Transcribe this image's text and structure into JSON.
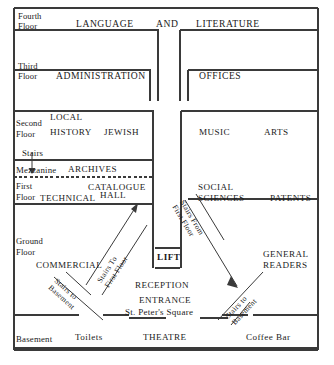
{
  "diagram": {
    "type": "building-section-plan",
    "line_color": "#3a3a3a",
    "background": "#ffffff"
  },
  "floors": [
    {
      "id": "fourth",
      "label_line1": "Fourth",
      "label_line2": "Floor",
      "left_departments": [
        "LANGUAGE",
        "AND"
      ],
      "right_departments": [
        "LITERATURE"
      ]
    },
    {
      "id": "third",
      "label_line1": "Third",
      "label_line2": "Floor",
      "left_departments": [
        "ADMINISTRATION"
      ],
      "right_departments": [
        "OFFICES"
      ]
    },
    {
      "id": "second",
      "label_line1": "Second",
      "label_line2": "Floor",
      "left_departments": [
        "LOCAL",
        "HISTORY",
        "JEWISH"
      ],
      "right_departments": [
        "MUSIC",
        "ARTS"
      ]
    },
    {
      "id": "mezzanine",
      "label_line1": "Mezzanine",
      "label_line2": "",
      "left_departments": [
        "ARCHIVES"
      ],
      "right_departments": []
    },
    {
      "id": "first",
      "label_line1": "First",
      "label_line2": "Floor",
      "left_departments": [
        "CATALOGUE",
        "TECHNICAL",
        "HALL"
      ],
      "right_departments": [
        "SOCIAL",
        "SCIENCES",
        "PATENTS"
      ]
    },
    {
      "id": "ground",
      "label_line1": "Ground",
      "label_line2": "Floor",
      "left_departments": [
        "COMMERCIAL"
      ],
      "right_departments": [
        "GENERAL",
        "READERS"
      ]
    },
    {
      "id": "basement",
      "label_line1": "Basement",
      "label_line2": "",
      "left_departments": [
        "Toilets"
      ],
      "right_departments": [
        "THEATRE",
        "Coffee Bar"
      ]
    }
  ],
  "labels": {
    "fourth_floor_1": "Fourth",
    "fourth_floor_2": "Floor",
    "language": "LANGUAGE",
    "and": "AND",
    "literature": "LITERATURE",
    "third_floor_1": "Third",
    "third_floor_2": "Floor",
    "administration": "ADMINISTRATION",
    "offices": "OFFICES",
    "second_floor_1": "Second",
    "second_floor_2": "Floor",
    "local": "LOCAL",
    "history": "HISTORY",
    "jewish": "JEWISH",
    "music": "MUSIC",
    "arts": "ARTS",
    "stairs": "Stairs",
    "mezzanine": "Mezzanine",
    "archives": "ARCHIVES",
    "first_floor_1": "First",
    "first_floor_2": "Floor",
    "catalogue": "CATALOGUE",
    "technical": "TECHNICAL",
    "hall": "HALL",
    "social": "SOCIAL",
    "sciences": "SCIENCES",
    "patents": "PATENTS",
    "ground_floor_1": "Ground",
    "ground_floor_2": "Floor",
    "commercial": "COMMERCIAL",
    "lift": "LIFT",
    "general": "GENERAL",
    "readers": "READERS",
    "reception": "RECEPTION",
    "entrance": "ENTRANCE",
    "st_peters_square": "St. Peter's Square",
    "basement": "Basement",
    "toilets": "Toilets",
    "theatre": "THEATRE",
    "coffee_bar": "Coffee Bar"
  },
  "stairs": [
    {
      "id": "stairs-to-first-floor",
      "line1": "Stairs To",
      "line2": "First Floor",
      "direction": "up-right"
    },
    {
      "id": "stairs-from-first-floor",
      "line1": "Stairs From",
      "line2": "First Floor",
      "direction": "down-right"
    },
    {
      "id": "stairs-to-basement-left",
      "line1": "Stairs to",
      "line2": "Basement",
      "direction": "down-right"
    },
    {
      "id": "stairs-to-basement-right",
      "line1": "Stairs to",
      "line2": "Basement",
      "direction": "up-right"
    },
    {
      "id": "stairs-to-mezzanine",
      "line1": "Stairs",
      "line2": "",
      "direction": "down"
    }
  ]
}
